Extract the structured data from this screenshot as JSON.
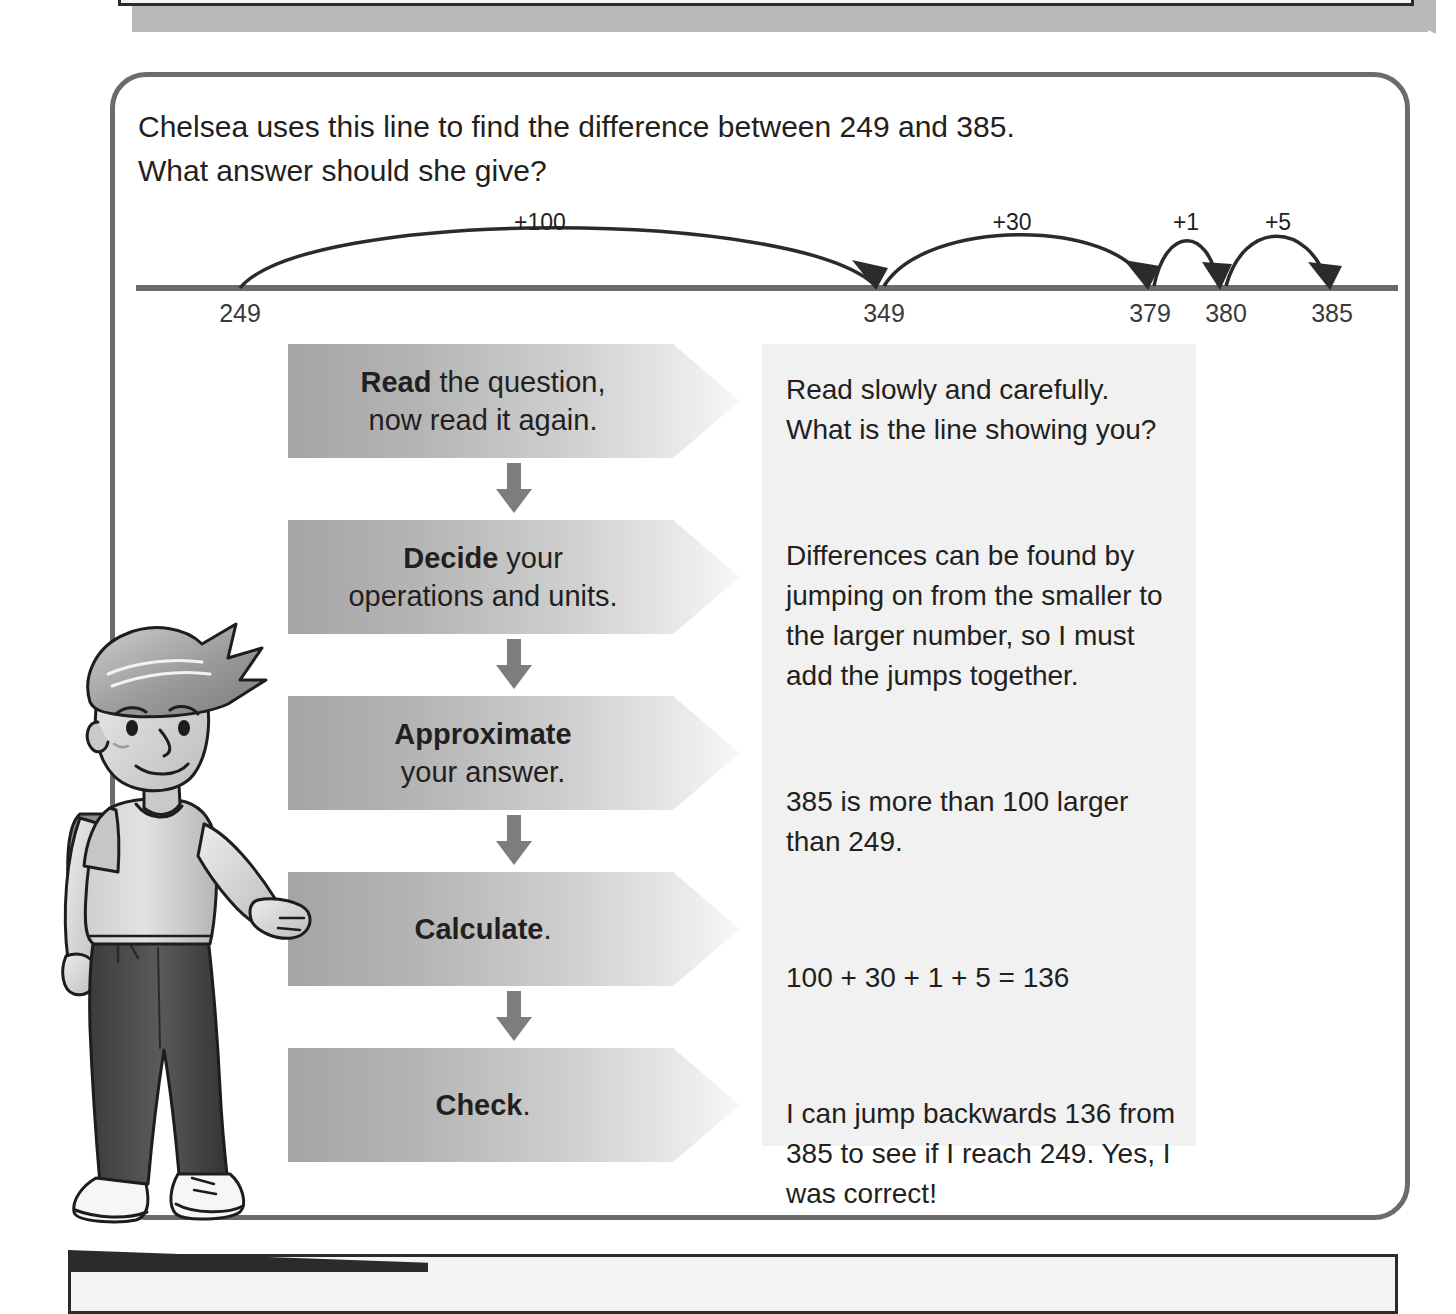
{
  "question": {
    "line1": "Chelsea uses this line to find the difference between 249 and 385.",
    "line2": "What answer should she give?"
  },
  "number_line": {
    "start_label": "249",
    "end_label": "385",
    "ticks": [
      "249",
      "349",
      "379",
      "380",
      "385"
    ],
    "jumps": [
      {
        "label": "+100",
        "from": "249",
        "to": "349",
        "value": 100
      },
      {
        "label": "+30",
        "from": "349",
        "to": "379",
        "value": 30
      },
      {
        "label": "+1",
        "from": "379",
        "to": "380",
        "value": 1
      },
      {
        "label": "+5",
        "from": "380",
        "to": "385",
        "value": 5
      }
    ]
  },
  "flow_steps": [
    {
      "bold": "Read",
      "rest": " the question,",
      "line2": "now read it again."
    },
    {
      "bold": "Decide",
      "rest": " your",
      "line2": "operations and units."
    },
    {
      "bold": "Approximate",
      "rest": "",
      "line2": "your answer."
    },
    {
      "bold": "Calculate",
      "rest": ".",
      "line2": ""
    },
    {
      "bold": "Check",
      "rest": ".",
      "line2": ""
    }
  ],
  "commentary": {
    "p1": "Read slowly and carefully. What is the line showing you?",
    "p2": "Differences can be found by jumping on from the smaller to the larger number, so I must add the jumps together.",
    "p3": "385 is more than 100 larger than 249.",
    "p4": "100 + 30 + 1 + 5 = 136",
    "p5": "I can jump backwards 136 from 385 to see if I reach 249. Yes, I was correct!"
  },
  "answer": "136",
  "colors": {
    "panel_border": "#6b6b6b",
    "arrow_dark": "#a5a5a5",
    "arrow_light": "#f7f7f7",
    "commentary_bg": "#f1f1f1",
    "text": "#231f20",
    "line": "#6b6b6b",
    "connector_arrow": "#7d7d7d"
  }
}
